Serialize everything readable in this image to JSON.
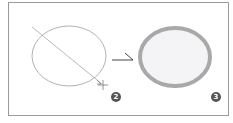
{
  "diagram": {
    "step_before": {
      "label": "2",
      "shape": "ellipse",
      "stroke": "#a8a8a8",
      "guide_line": "diagonal drag line",
      "cursor": "crosshair"
    },
    "arrow": {
      "direction": "right",
      "color": "#444444"
    },
    "step_after": {
      "label": "3",
      "shape": "ellipse",
      "stroke": "#a9a9a9",
      "fill": "#f4f4f6"
    },
    "colors": {
      "frame_border": "#9a9a9a",
      "badge_fill": "#555555",
      "badge_text": "#ffffff"
    }
  }
}
